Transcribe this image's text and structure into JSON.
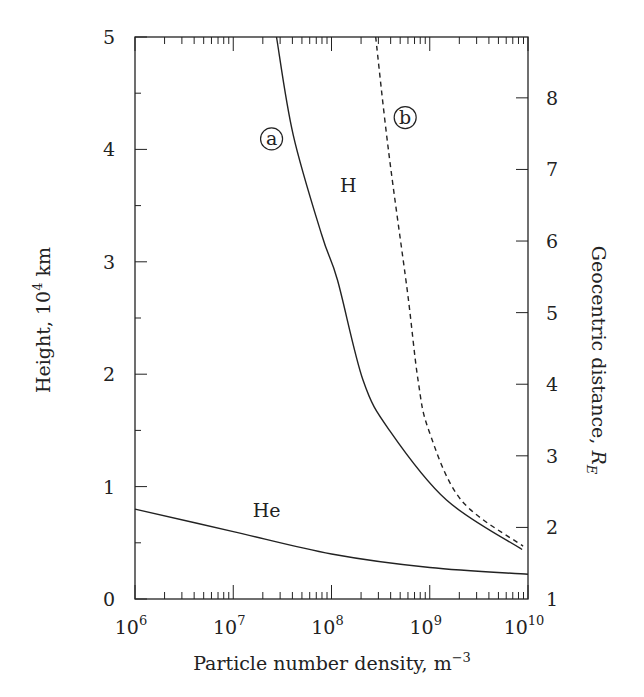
{
  "chart_data": {
    "type": "line",
    "title": "",
    "xlabel": "Particle number density, m^-3",
    "xlabel_main": "Particle number density, m",
    "xlabel_sup": "−3",
    "ylabel": "Height, 10^4 km",
    "ylabel_main": "Height, 10",
    "ylabel_sup": "4",
    "ylabel_unit": " km",
    "y2label": "Geocentric distance, R_E",
    "y2label_main": "Geocentric distance, ",
    "y2label_var": "R",
    "y2label_sub": "E",
    "xscale": "log",
    "xlim": [
      1000000.0,
      10000000000.0
    ],
    "ylim": [
      0,
      5
    ],
    "y2lim": [
      1,
      8.85
    ],
    "x_ticks": [
      {
        "exp": 6,
        "base": "10",
        "sup": "6"
      },
      {
        "exp": 7,
        "base": "10",
        "sup": "7"
      },
      {
        "exp": 8,
        "base": "10",
        "sup": "8"
      },
      {
        "exp": 9,
        "base": "10",
        "sup": "9"
      },
      {
        "exp": 10,
        "base": "10",
        "sup": "10"
      }
    ],
    "y_ticks": [
      "0",
      "1",
      "2",
      "3",
      "4",
      "5"
    ],
    "y2_ticks": [
      "1",
      "2",
      "3",
      "4",
      "5",
      "6",
      "7",
      "8"
    ],
    "grid": false,
    "legend": null,
    "series": [
      {
        "name": "H (a)",
        "style": "solid",
        "log10_x": [
          7.44,
          7.61,
          7.9,
          8.06,
          8.32,
          8.59,
          9.17,
          9.94
        ],
        "y": [
          5.0,
          4.13,
          3.24,
          2.84,
          1.95,
          1.5,
          0.88,
          0.44
        ]
      },
      {
        "name": "H (b)",
        "style": "dashed",
        "log10_x": [
          8.45,
          8.58,
          8.77,
          8.88,
          8.99,
          9.32,
          9.95
        ],
        "y": [
          5.0,
          3.99,
          2.75,
          1.95,
          1.5,
          0.88,
          0.47
        ]
      },
      {
        "name": "He",
        "style": "solid",
        "log10_x": [
          6.0,
          7.0,
          8.0,
          9.0,
          10.0
        ],
        "y": [
          0.8,
          0.6,
          0.4,
          0.28,
          0.22
        ]
      }
    ],
    "annotations": [
      {
        "text": "a",
        "circled": true,
        "log10_x": 7.39,
        "y": 4.04
      },
      {
        "text": "b",
        "circled": true,
        "log10_x": 8.75,
        "y": 4.23
      },
      {
        "text": "H",
        "circled": false,
        "log10_x": 8.17,
        "y": 3.62
      },
      {
        "text": "He",
        "circled": false,
        "log10_x": 7.34,
        "y": 0.73
      }
    ]
  },
  "colors": {
    "ink": "#222222",
    "background": "#ffffff"
  }
}
